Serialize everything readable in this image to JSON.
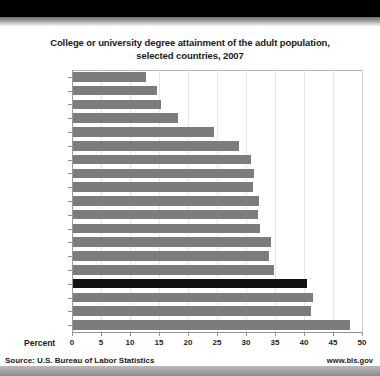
{
  "chart_data": {
    "type": "bar",
    "orientation": "horizontal",
    "title": "College or university degree attainment of the adult population, selected countries, 2007",
    "title_line1": "College or university degree attainment of the adult population,",
    "title_line2": "selected countries, 2007",
    "xlabel": "Percent",
    "ylabel": "",
    "xlim": [
      0,
      50
    ],
    "xticks": [
      "0",
      "5",
      "10",
      "15",
      "20",
      "25",
      "30",
      "35",
      "40",
      "45",
      "50"
    ],
    "xtick_values": [
      0,
      5,
      10,
      15,
      20,
      25,
      30,
      35,
      40,
      45,
      50
    ],
    "grid": true,
    "legend": "none",
    "categories": [
      "Italy",
      "Portugal",
      "Mexico",
      "Austria",
      "Germany",
      "France",
      "Spain",
      "Netherlands",
      "Sweden",
      "Denmark",
      "Ireland",
      "United Kingdom",
      "Australia",
      "Norway",
      "Korea, Rep. of",
      "United States",
      "Japan",
      "New Zealand",
      "Canada"
    ],
    "values": [
      12.6,
      14.5,
      15.2,
      18.1,
      24.3,
      28.6,
      30.7,
      31.2,
      31.0,
      32.1,
      31.9,
      32.2,
      34.1,
      33.8,
      34.7,
      40.4,
      41.3,
      41.0,
      47.7
    ],
    "highlight_category": "United States",
    "colors": {
      "bar": "#7c7c7c",
      "bar_highlight": "#111111",
      "grid": "#e6e6e6",
      "axis": "#8f8f8f",
      "text": "#1a1a1a",
      "background": "#ffffff"
    }
  },
  "footer": {
    "source": "Source: U.S. Bureau of Labor Statistics",
    "url": "www.bls.gov"
  }
}
